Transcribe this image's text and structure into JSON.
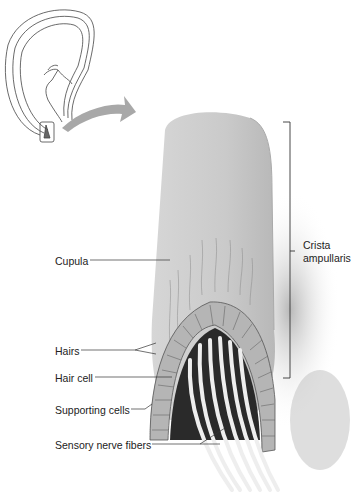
{
  "diagram": {
    "inset": {
      "description": "semicircular canal outline with ampulla highlighted"
    },
    "labels": {
      "cupula": "Cupula",
      "hairs": "Hairs",
      "hair_cell": "Hair cell",
      "supporting_cells": "Supporting cells",
      "sensory_nerve_fibers": "Sensory nerve fibers",
      "crista_line1": "Crista",
      "crista_line2": "ampullaris"
    },
    "colors": {
      "line": "#333333",
      "cupula": "#c9c9c9",
      "arrow": "#a8a8a8",
      "text": "#222222"
    }
  }
}
